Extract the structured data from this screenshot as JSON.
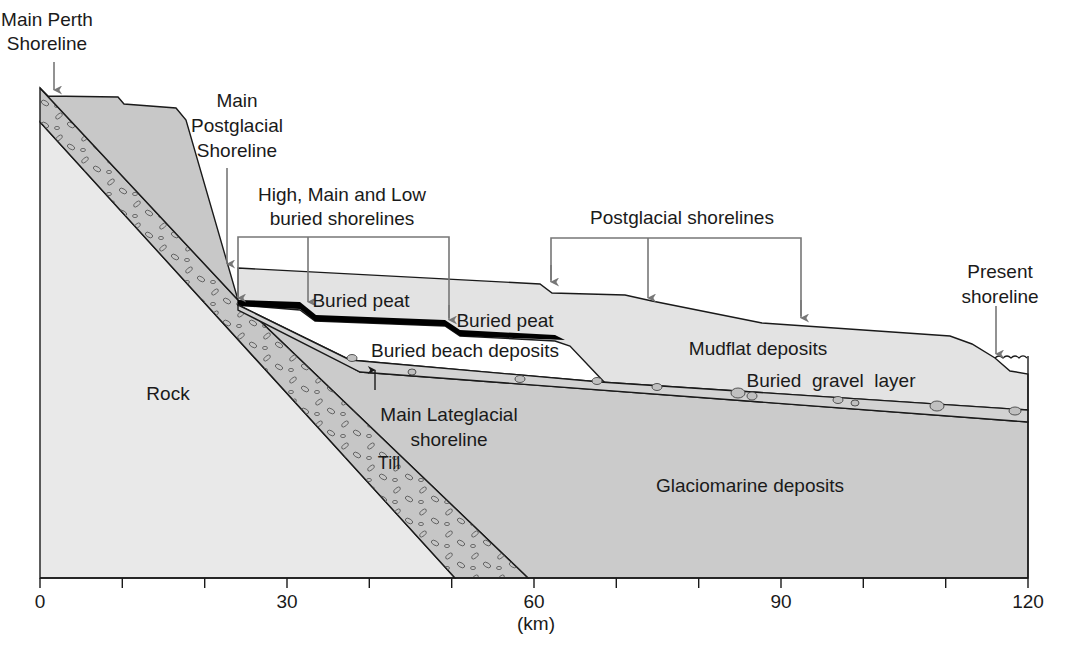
{
  "figure": {
    "x_axis": {
      "unit_label": "(km)",
      "ticks": [
        "0",
        "30",
        "60",
        "90",
        "120"
      ],
      "range": [
        0,
        120
      ],
      "minor_tick_interval_km": 10
    }
  },
  "labels": {
    "main_perth_1": "Main Perth",
    "main_perth_2": "Shoreline",
    "main_postglacial_1": "Main",
    "main_postglacial_2": "Postglacial",
    "main_postglacial_3": "Shoreline",
    "buried_shorelines_1": "High, Main and Low",
    "buried_shorelines_2": "buried shorelines",
    "postglacial_shorelines": "Postglacial shorelines",
    "present_shoreline_1": "Present",
    "present_shoreline_2": "shoreline",
    "buried_peat_upper": "Buried peat",
    "buried_peat_lower": "Buried peat",
    "buried_beach": "Buried beach deposits",
    "mudflat": "Mudflat deposits",
    "gravel": "Buried  gravel  layer",
    "rock": "Rock",
    "main_lateglacial_1": "Main Lateglacial",
    "main_lateglacial_2": "shoreline",
    "till": "Till",
    "glaciomarine": "Glaciomarine deposits"
  },
  "layers": [
    {
      "name": "Rock",
      "color": "#e9e9e9"
    },
    {
      "name": "Till",
      "color": "#c6c6c6"
    },
    {
      "name": "Upper slope deposits",
      "color": "#c8c8c8"
    },
    {
      "name": "Glaciomarine deposits",
      "color": "#cbcbcb"
    },
    {
      "name": "Mudflat deposits",
      "color": "#e3e3e3"
    },
    {
      "name": "Buried beach deposits",
      "color": "#ffffff"
    },
    {
      "name": "Buried peat",
      "color": "#000000"
    },
    {
      "name": "Buried gravel layer",
      "color": "#d2d2d2"
    }
  ],
  "colors": {
    "outline": "#1a1a1a",
    "arrow": "#777777",
    "text": "#1a1a1a"
  }
}
